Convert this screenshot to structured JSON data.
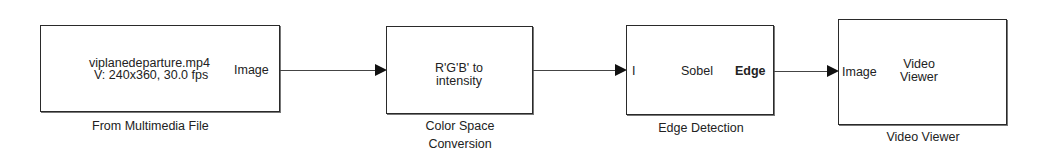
{
  "diagram": {
    "blocks": [
      {
        "id": "from-multimedia-file",
        "caption": "From Multimedia File",
        "content_lines": [
          "viplanedeparture.mp4",
          "V: 240x360, 30.0 fps"
        ],
        "output_port": "Image"
      },
      {
        "id": "color-space-conversion",
        "caption_lines": [
          "Color Space",
          "Conversion"
        ],
        "content_lines": [
          "R'G'B' to",
          "intensity"
        ]
      },
      {
        "id": "edge-detection",
        "caption": "Edge Detection",
        "input_port": "I",
        "method": "Sobel",
        "output_port": "Edge"
      },
      {
        "id": "video-viewer",
        "caption": "Video Viewer",
        "input_port": "Image",
        "content_lines": [
          "Video",
          "Viewer"
        ]
      }
    ],
    "connections": [
      {
        "from": "from-multimedia-file",
        "to": "color-space-conversion"
      },
      {
        "from": "color-space-conversion",
        "to": "edge-detection"
      },
      {
        "from": "edge-detection",
        "to": "video-viewer"
      }
    ]
  }
}
